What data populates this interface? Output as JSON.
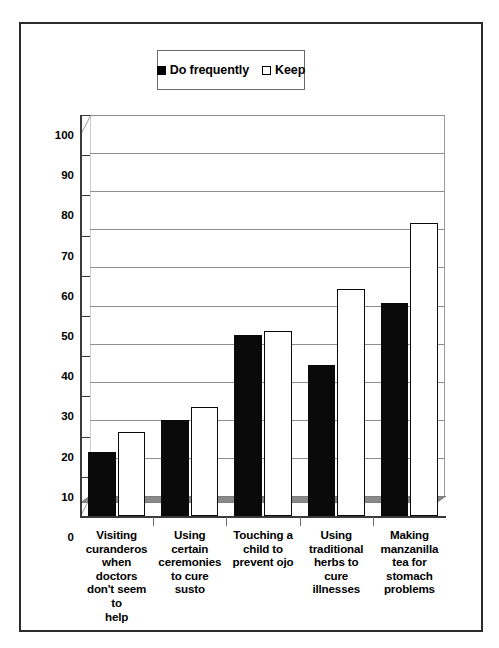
{
  "figure": {
    "border_color": "#2b2b2b",
    "background": "#ffffff"
  },
  "legend": {
    "position": "top-center",
    "entries": [
      {
        "marker": "filled-square-swatch",
        "label": "Do frequently",
        "color": "#000000"
      },
      {
        "marker": "hollow-square-swatch",
        "label": "Keep",
        "color": "#ffffff"
      }
    ]
  },
  "axis": {
    "y_ticks": [
      "100",
      "90",
      "80",
      "70",
      "60",
      "50",
      "40",
      "30",
      "20",
      "10",
      "0"
    ]
  },
  "chart_data": {
    "type": "bar",
    "title": "",
    "subtitle": "",
    "xlabel": "",
    "ylabel": "",
    "ylim": [
      0,
      100
    ],
    "ytick_step": 10,
    "grid": true,
    "legend_position": "top-center",
    "style": "3d-column",
    "categories": [
      "Visiting curanderos when doctors don't seem to help",
      "Using certain ceremonies to cure susto",
      "Touching a child to prevent ojo",
      "Using traditional herbs to cure illnesses",
      "Making manzanilla tea for stomach problems"
    ],
    "category_lines": [
      [
        "Visiting",
        "curanderos",
        "when doctors",
        "don't seem to",
        "help"
      ],
      [
        "Using certain",
        "ceremonies",
        "to cure susto"
      ],
      [
        "Touching a",
        "child to",
        "prevent ojo"
      ],
      [
        "Using",
        "traditional",
        "herbs to cure",
        "illnesses"
      ],
      [
        "Making",
        "manzanilla",
        "tea for",
        "stomach",
        "problems"
      ]
    ],
    "series": [
      {
        "name": "Do frequently",
        "color": "#000000",
        "values": [
          16,
          24,
          45,
          37.5,
          53
        ]
      },
      {
        "name": "Keep",
        "color": "#ffffff",
        "values": [
          21,
          27,
          46,
          56.5,
          73
        ]
      }
    ]
  }
}
